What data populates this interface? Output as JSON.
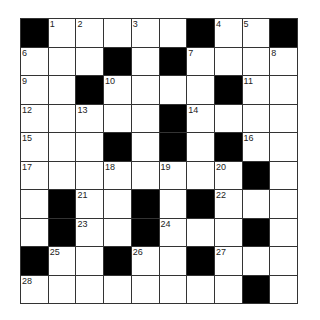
{
  "puzzle": {
    "rows": 10,
    "cols": 10,
    "colors": {
      "block": "#000000",
      "cell": "#ffffff",
      "line": "#333333"
    },
    "grid": [
      [
        "#",
        "1",
        "2",
        "",
        "3",
        "",
        "#",
        "4",
        "5",
        "#"
      ],
      [
        "6",
        "",
        "",
        "#",
        "",
        "#",
        "7",
        "",
        "",
        "8"
      ],
      [
        "9",
        "",
        "#",
        "10",
        "",
        "",
        "",
        "#",
        "11",
        ""
      ],
      [
        "12",
        "",
        "13",
        "",
        "",
        "#",
        "14",
        "",
        "",
        ""
      ],
      [
        "15",
        "",
        "",
        "#",
        "",
        "#",
        "",
        "#",
        "16",
        ""
      ],
      [
        "17",
        "",
        "",
        "18",
        "",
        "19",
        "",
        "20",
        "#",
        ""
      ],
      [
        "",
        "#",
        "21",
        "",
        "#",
        "",
        "#",
        "22",
        "",
        ""
      ],
      [
        "",
        "#",
        "23",
        "",
        "#",
        "24",
        "",
        "",
        "#",
        ""
      ],
      [
        "#",
        "25",
        "",
        "#",
        "26",
        "",
        "#",
        "27",
        "",
        ""
      ],
      [
        "28",
        "",
        "",
        "",
        "",
        "",
        "",
        "",
        "#",
        ""
      ]
    ]
  }
}
